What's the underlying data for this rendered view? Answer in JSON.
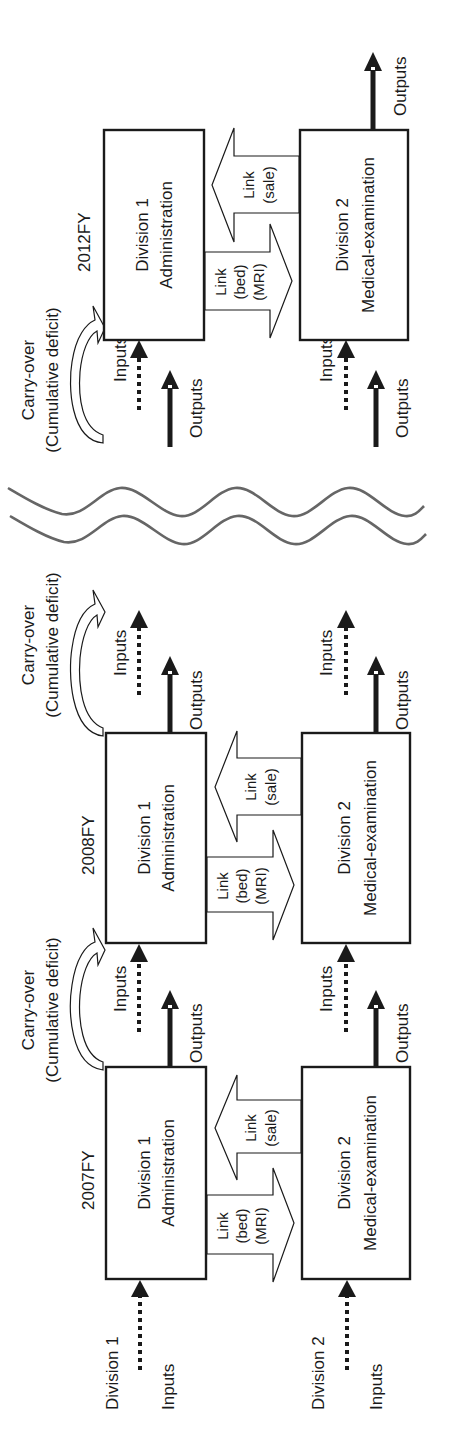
{
  "diagram": {
    "orientation": "rotated 90 degrees counter-clockwise",
    "colors": {
      "ink": "#1a1a1a",
      "wave": "#666666",
      "background": "#ffffff"
    },
    "left_labels": {
      "division1": "Division 1",
      "division1_inputs": "Inputs",
      "division2": "Division 2",
      "division2_inputs": "Inputs"
    },
    "periods": [
      {
        "year": "2007FY",
        "division1": {
          "line1": "Division 1",
          "line2": "Administration"
        },
        "division2": {
          "line1": "Division 2",
          "line2": "Medical-examination"
        },
        "link_down": {
          "line1": "Link",
          "line2": "(bed)",
          "line3": "(MRI)"
        },
        "link_up": {
          "line1": "Link",
          "line2": "(sale)"
        },
        "d1_outputs": "Outputs",
        "d2_outputs": "Outputs"
      },
      {
        "year": "2008FY",
        "carry_over": {
          "line1": "Carry-over",
          "line2": "(Cumulative deficit)"
        },
        "d1_inputs": "Inputs",
        "d2_inputs": "Inputs",
        "division1": {
          "line1": "Division 1",
          "line2": "Administration"
        },
        "division2": {
          "line1": "Division 2",
          "line2": "Medical-examination"
        },
        "link_down": {
          "line1": "Link",
          "line2": "(bed)",
          "line3": "(MRI)"
        },
        "link_up": {
          "line1": "Link",
          "line2": "(sale)"
        },
        "d1_outputs": "Outputs",
        "d2_outputs": "Outputs"
      },
      {
        "year": "2012FY",
        "carry_over": {
          "line1": "Carry-over",
          "line2": "(Cumulative deficit)"
        },
        "d1_inputs": "Inputs",
        "d2_inputs": "Inputs",
        "d1_outputs_in": "Outputs",
        "d2_outputs_in": "Outputs",
        "division1": {
          "line1": "Division 1",
          "line2": "Administration"
        },
        "division2": {
          "line1": "Division 2",
          "line2": "Medical-examination"
        },
        "link_down": {
          "line1": "Link",
          "line2": "(bed)",
          "line3": "(MRI)"
        },
        "link_up": {
          "line1": "Link",
          "line2": "(sale)"
        },
        "d2_outputs": "Outputs"
      }
    ],
    "carry_over_2009": {
      "line1": "Carry-over",
      "line2": "(Cumulative deficit)"
    },
    "carry_over_2009_inputs": {
      "d1": "Inputs",
      "d2": "Inputs"
    },
    "carry_over_2009_outputs": {
      "d1": "Outputs",
      "d2": "Outputs"
    }
  }
}
